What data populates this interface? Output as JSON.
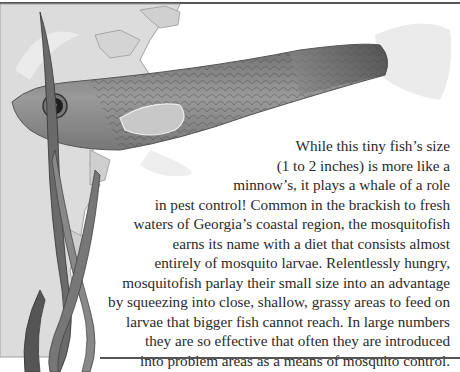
{
  "article": {
    "lines": [
      "While this tiny fish’s size",
      "(1 to 2 inches) is more like a",
      "minnow’s, it plays a whale of a role",
      "in pest control! Common in the brackish to fresh",
      "waters of Georgia’s coastal region, the mosquitofish",
      "earns its name with a diet that consists almost",
      "entirely of mosquito larvae. Relentlessly hungry,",
      "mosquitofish parlay their small size into an advantage",
      "by squeezing into close, shallow, grassy areas to feed on",
      "larvae that bigger fish cannot reach. In large numbers",
      "they are so effective that often they are introduced",
      "into problem areas as a means of mosquito control."
    ]
  },
  "illustration": {
    "subject": "mosquitofish",
    "background": "georgia-coastal-map",
    "colors": {
      "map": "#d6d6d6",
      "map_outline": "#9a9a9a",
      "fish_body": "#8a8a8a",
      "fish_dark": "#555555",
      "fins": "#e8e8e8",
      "grass": "#6f6f6f",
      "rule": "#555555"
    }
  }
}
